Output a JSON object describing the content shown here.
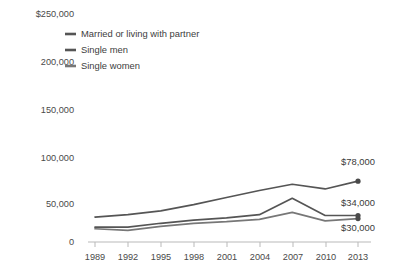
{
  "chart_data": {
    "type": "line",
    "title": "",
    "subtitle": "",
    "xlabel": "",
    "ylabel": "",
    "grid": false,
    "legend_position": "top-left",
    "categories": [
      "1989",
      "1992",
      "1995",
      "1998",
      "2001",
      "2004",
      "2007",
      "2010",
      "2013"
    ],
    "x": [
      1989,
      1992,
      1995,
      1998,
      2001,
      2004,
      2007,
      2010,
      2013
    ],
    "ylim": [
      0,
      250000
    ],
    "yticks": [
      0,
      50000,
      100000,
      150000,
      200000,
      250000
    ],
    "ytick_labels": [
      "0",
      "50,000",
      "100,000",
      "150,000",
      "200,000",
      "$250,000"
    ],
    "xtick_labels": [
      "1989",
      "1992",
      "1995",
      "1998",
      "2001",
      "2004",
      "2007",
      "2010",
      "2013"
    ],
    "series": [
      {
        "name": "Married or living with partner",
        "values": [
          32000,
          35000,
          40000,
          48000,
          57000,
          66000,
          74000,
          68000,
          78000
        ],
        "end_label": "$78,000",
        "color": "#555555"
      },
      {
        "name": "Single men",
        "values": [
          19000,
          19000,
          24000,
          28000,
          31000,
          35000,
          56000,
          34000,
          34000
        ],
        "end_label": "$34,000",
        "color": "#555555"
      },
      {
        "name": "Single women",
        "values": [
          17000,
          15000,
          20000,
          24000,
          26000,
          29000,
          38000,
          27000,
          30000
        ],
        "end_label": "$30,000",
        "color": "#777777"
      }
    ]
  },
  "legend": {
    "items": [
      {
        "label": "Married or living with partner"
      },
      {
        "label": "Single men"
      },
      {
        "label": "Single women"
      }
    ]
  },
  "y_axis": {
    "labels": [
      "$250,000",
      "200,000",
      "150,000",
      "100,000",
      "50,000",
      "0"
    ]
  },
  "x_axis": {
    "labels": [
      "1989",
      "1992",
      "1995",
      "1998",
      "2001",
      "2004",
      "2007",
      "2010",
      "2013"
    ]
  },
  "endpoint_labels": {
    "married": "$78,000",
    "single_men": "$34,000",
    "single_women": "$30,000"
  },
  "colors": {
    "background": "#ffffff",
    "line_dark": "#555555",
    "line_light": "#777777",
    "text": "#3f3f3f",
    "axis": "#b9b9b9"
  }
}
